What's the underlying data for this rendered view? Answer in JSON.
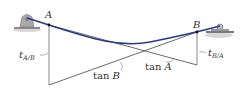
{
  "diagram": {
    "type": "beam deflection tangent geometry",
    "points": {
      "A": {
        "label": "A"
      },
      "B": {
        "label": "B"
      }
    },
    "labels": {
      "t_AB": {
        "t": "t",
        "sub": "A/B"
      },
      "t_BA": {
        "t": "t",
        "sub": "B/A"
      },
      "tanB": {
        "prefix": "tan ",
        "var": "B"
      },
      "tanA": {
        "prefix": "tan ",
        "var": "A"
      }
    },
    "colors": {
      "beam": "#2d3a8c",
      "lines": "#444444",
      "support": "#9a9a9a",
      "ground": "#c8c8c8"
    }
  }
}
